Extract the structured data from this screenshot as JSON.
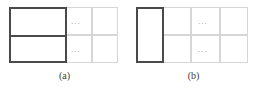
{
  "figure": {
    "type": "diagram",
    "colors": {
      "bold_border": "#4a4a4a",
      "cell_border": "#d6d6d6",
      "ellipsis": "#9a9a9a",
      "background": "#ffffff",
      "caption_text": "#3a3a3a"
    },
    "panels": [
      {
        "id": "a",
        "caption": "(a)",
        "rows": 2,
        "bold_block": {
          "label": "",
          "spans_rows": 2,
          "spans_columns": 2,
          "has_inner_divider": true
        },
        "trailing_cells_per_row": 2,
        "ellipsis_text_row1": "...",
        "ellipsis_text_row2": "..."
      },
      {
        "id": "b",
        "caption": "(b)",
        "rows": 2,
        "bold_block": {
          "label": "",
          "spans_rows": 2,
          "spans_columns": 1,
          "has_inner_divider": false
        },
        "trailing_cells_per_row": 3,
        "ellipsis_text_row1": "...",
        "ellipsis_text_row2": "..."
      }
    ]
  }
}
